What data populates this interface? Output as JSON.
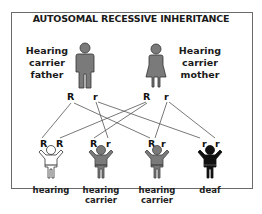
{
  "title": "AUTOSOMAL RECESSIVE INHERITANCE",
  "parents": {
    "father": {
      "label_lines": [
        "Hearing",
        "carrier",
        "father"
      ],
      "alleles": [
        "R",
        "r"
      ],
      "color": "#7a7a7a"
    },
    "mother": {
      "label_lines": [
        "Hearing",
        "carrier",
        "mother"
      ],
      "alleles": [
        "R",
        "r"
      ],
      "color": "#7a7a7a"
    }
  },
  "children": [
    {
      "alleles": [
        "R",
        "R"
      ],
      "label_lines": [
        "hearing"
      ],
      "color": "#ffffff"
    },
    {
      "alleles": [
        "R",
        "r"
      ],
      "label_lines": [
        "hearing",
        "carrier"
      ],
      "color": "#7a7a7a"
    },
    {
      "alleles": [
        "R",
        "r"
      ],
      "label_lines": [
        "hearing",
        "carrier"
      ],
      "color": "#7a7a7a"
    },
    {
      "alleles": [
        "r",
        "r"
      ],
      "label_lines": [
        "deaf"
      ],
      "color": "#111111"
    }
  ],
  "connections": [
    {
      "from": "father-R",
      "to": "child1-R1"
    },
    {
      "from": "father-R",
      "to": "child3-R"
    },
    {
      "from": "father-r",
      "to": "child2-r"
    },
    {
      "from": "father-r",
      "to": "child4-r1"
    },
    {
      "from": "mother-R",
      "to": "child1-R2"
    },
    {
      "from": "mother-R",
      "to": "child2-R"
    },
    {
      "from": "mother-r",
      "to": "child3-r"
    },
    {
      "from": "mother-r",
      "to": "child4-r2"
    }
  ]
}
